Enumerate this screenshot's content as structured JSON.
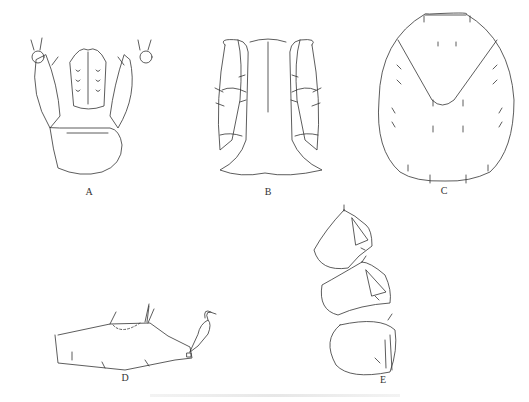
{
  "figure": {
    "panels": [
      {
        "id": "A",
        "label": "A",
        "description": "gnathosoma / capitulum dorsal view with palps"
      },
      {
        "id": "B",
        "label": "B",
        "description": "palps and hypostome ventral view"
      },
      {
        "id": "C",
        "label": "C",
        "description": "dorsal shield / scutum with setae"
      },
      {
        "id": "D",
        "label": "D",
        "description": "leg segment lateral view with claw"
      },
      {
        "id": "E",
        "label": "E",
        "description": "leg segments (three) with setae"
      }
    ],
    "caption": ""
  },
  "colors": {
    "line": "#333333",
    "background": "#ffffff"
  }
}
